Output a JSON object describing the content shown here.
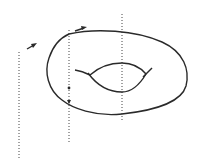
{
  "diagram": {
    "colors": {
      "background": "#ffffff",
      "stroke": "#2a2a2a",
      "dotted": "#444444"
    },
    "dotted_lines": [
      {
        "id": "left",
        "x": 19,
        "y1": 52,
        "y2": 160
      },
      {
        "id": "middle",
        "x": 69,
        "y1": 30,
        "y2": 143
      },
      {
        "id": "right",
        "x": 122,
        "y1": 14,
        "y2": 122
      }
    ],
    "arrows": [
      {
        "id": "arrow-left",
        "x1": 27,
        "y1": 49,
        "x2": 36,
        "y2": 44
      },
      {
        "id": "arrow-middle",
        "x1": 75,
        "y1": 31,
        "x2": 86,
        "y2": 27
      }
    ],
    "markers": [
      {
        "id": "dot-on-middle-line",
        "x": 69,
        "y": 88
      }
    ]
  }
}
